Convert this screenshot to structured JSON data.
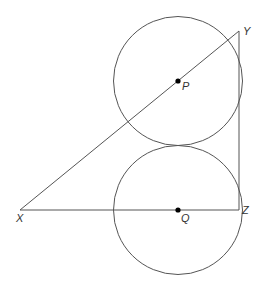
{
  "diagram": {
    "colors": {
      "stroke": "#555555",
      "point": "#000000",
      "label": "#333333",
      "background": "#ffffff"
    },
    "circles": [
      {
        "name": "P",
        "cx": 178,
        "cy": 81,
        "r": 64.5
      },
      {
        "name": "Q",
        "cx": 178,
        "cy": 210,
        "r": 64.5
      }
    ],
    "points": {
      "X": {
        "x": 20,
        "y": 210
      },
      "Y": {
        "x": 239,
        "y": 31
      },
      "Z": {
        "x": 239,
        "y": 210
      },
      "P": {
        "x": 178,
        "y": 81
      },
      "Q": {
        "x": 178,
        "y": 210
      }
    },
    "labels": {
      "X": "X",
      "Y": "Y",
      "Z": "Z",
      "P": "P",
      "Q": "Q"
    },
    "segments": [
      "XY",
      "YZ",
      "XZ"
    ]
  }
}
